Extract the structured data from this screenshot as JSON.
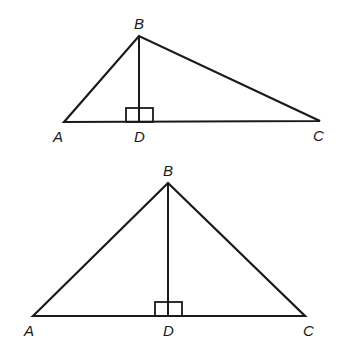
{
  "figures": [
    {
      "id": "top",
      "description": "Obtuse-looking scalene triangle ABC with altitude BD to AC",
      "vertices": {
        "A": {
          "x": 64,
          "y": 122,
          "label": "A",
          "lx": 53,
          "ly": 142
        },
        "B": {
          "x": 139,
          "y": 36,
          "label": "B",
          "lx": 134,
          "ly": 29
        },
        "C": {
          "x": 320,
          "y": 121,
          "label": "C",
          "lx": 313,
          "ly": 141
        },
        "D": {
          "x": 139,
          "y": 122,
          "label": "D",
          "lx": 134,
          "ly": 142
        }
      },
      "right_angle_mark": {
        "x": 126,
        "y": 108,
        "w": 27,
        "h": 14
      }
    },
    {
      "id": "bottom",
      "description": "Isosceles-looking triangle ABC with altitude BD to AC",
      "vertices": {
        "A": {
          "x": 33,
          "y": 316,
          "label": "A",
          "lx": 24,
          "ly": 336
        },
        "B": {
          "x": 168,
          "y": 183,
          "label": "B",
          "lx": 163,
          "ly": 176
        },
        "C": {
          "x": 305,
          "y": 316,
          "label": "C",
          "lx": 303,
          "ly": 336
        },
        "D": {
          "x": 168,
          "y": 316,
          "label": "D",
          "lx": 163,
          "ly": 336
        }
      },
      "right_angle_mark": {
        "x": 155,
        "y": 302,
        "w": 27,
        "h": 14
      }
    }
  ],
  "labels": {
    "top": {
      "A": "A",
      "B": "B",
      "C": "C",
      "D": "D"
    },
    "bottom": {
      "A": "A",
      "B": "B",
      "C": "C",
      "D": "D"
    }
  },
  "colors": {
    "stroke": "#1a1a1a",
    "background": "#ffffff"
  }
}
